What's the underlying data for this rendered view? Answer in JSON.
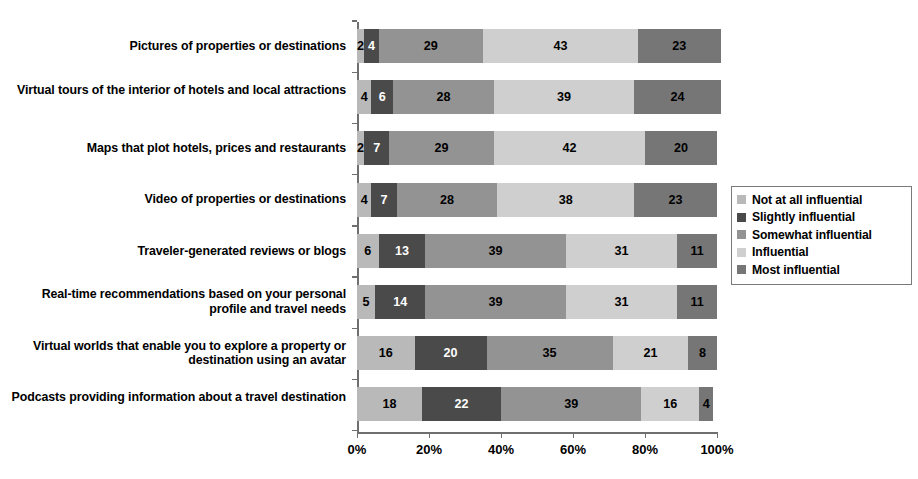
{
  "chart_data": {
    "type": "bar",
    "orientation": "horizontal",
    "stacked": true,
    "normalized_percent": true,
    "title": "",
    "subtitle": "",
    "xlabel": "",
    "ylabel": "",
    "xlim": [
      0,
      100
    ],
    "xticks": [
      "0%",
      "20%",
      "40%",
      "60%",
      "80%",
      "100%"
    ],
    "xtick_values": [
      0,
      20,
      40,
      60,
      80,
      100
    ],
    "grid": false,
    "legend_position": "right",
    "categories": [
      "Pictures of properties or destinations",
      "Virtual tours of the interior of hotels and local attractions",
      "Maps that plot hotels, prices and restaurants",
      "Video of properties or destinations",
      "Traveler-generated reviews or blogs",
      "Real-time recommendations based on your personal profile and travel needs",
      "Virtual worlds that enable you to explore a property or destination using an avatar",
      "Podcasts providing information about a travel destination"
    ],
    "series": [
      {
        "name": "Not at all influential",
        "color": "#b9b9b9",
        "label_color": "#000000",
        "values": [
          2,
          4,
          2,
          4,
          6,
          5,
          16,
          18
        ]
      },
      {
        "name": "Slightly influential",
        "color": "#4a4a4a",
        "label_color": "#ffffff",
        "values": [
          4,
          6,
          7,
          7,
          13,
          14,
          20,
          22
        ]
      },
      {
        "name": "Somewhat influential",
        "color": "#939393",
        "label_color": "#000000",
        "values": [
          29,
          28,
          29,
          28,
          39,
          39,
          35,
          39
        ]
      },
      {
        "name": "Influential",
        "color": "#cfcfcf",
        "label_color": "#000000",
        "values": [
          43,
          39,
          42,
          38,
          31,
          31,
          21,
          16
        ]
      },
      {
        "name": "Most influential",
        "color": "#767676",
        "label_color": "#000000",
        "values": [
          23,
          24,
          20,
          23,
          11,
          11,
          8,
          4
        ]
      }
    ]
  },
  "legend": {
    "items": [
      {
        "label": "Not at all influential"
      },
      {
        "label": "Slightly influential"
      },
      {
        "label": "Somewhat influential"
      },
      {
        "label": "Influential"
      },
      {
        "label": "Most influential"
      }
    ]
  },
  "axis": {
    "line_color": "#6f6f6f"
  }
}
